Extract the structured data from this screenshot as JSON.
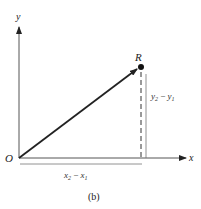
{
  "figure": {
    "caption": "(b)",
    "axes": {
      "x_label": "x",
      "y_label": "y",
      "origin_label": "O"
    },
    "point": {
      "label": "R"
    },
    "horizontal_span_label": {
      "a": "x",
      "a_sub": "2",
      "op": " − ",
      "b": "x",
      "b_sub": "1"
    },
    "vertical_span_label": {
      "a": "y",
      "a_sub": "2",
      "op": " − ",
      "b": "y",
      "b_sub": "1"
    },
    "colors": {
      "ink": "#222222",
      "thin": "#555555"
    }
  }
}
